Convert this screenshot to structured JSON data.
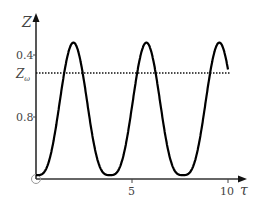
{
  "chart_data": {
    "type": "line",
    "title": "",
    "xlabel": "τ",
    "ylabel": "Z",
    "xlim": [
      0,
      10.5
    ],
    "ylim": [
      0,
      1.0
    ],
    "x_ticks": [
      {
        "value": 5,
        "label": "5"
      },
      {
        "value": 10,
        "label": "10"
      }
    ],
    "y_ticks": [
      {
        "value": 0.4,
        "label": "0.4"
      },
      {
        "value": 0.8,
        "label": "0.8"
      }
    ],
    "origin_label": "O",
    "grid": false,
    "legend": null,
    "series": [
      {
        "name": "Z(τ)",
        "style": "solid",
        "color": "#000000",
        "description": "periodic oscillation starting at 0, peaks ≈0.88 at τ≈1.9, 5.7, 9.5; minima ≈0.03 at τ≈0.1, 3.8, 7.6; ends ≈0.57 at τ≈10",
        "x": [
          0,
          1.0,
          1.9,
          2.8,
          3.8,
          4.8,
          5.7,
          6.6,
          7.6,
          8.6,
          9.5,
          10.0
        ],
        "y": [
          0.02,
          0.35,
          0.88,
          0.35,
          0.03,
          0.35,
          0.88,
          0.35,
          0.03,
          0.35,
          0.88,
          0.57
        ]
      },
      {
        "name": "Z_ω",
        "style": "dotted",
        "color": "#000000",
        "x": [
          0,
          10.0
        ],
        "y": [
          0.68,
          0.68
        ]
      }
    ],
    "annotations": [
      {
        "text": "Z_ω",
        "at": {
          "x": 0,
          "y": 0.68
        },
        "position": "left of y-axis"
      }
    ]
  }
}
